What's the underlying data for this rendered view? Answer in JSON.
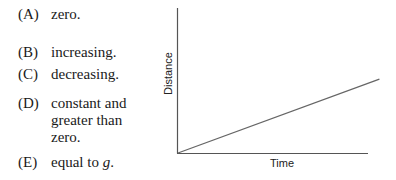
{
  "choices": [
    {
      "letter": "(A)",
      "text": "zero."
    },
    {
      "letter": "(B)",
      "text": "increasing."
    },
    {
      "letter": "(C)",
      "text": "decreasing."
    },
    {
      "letter": "(D)",
      "text": "constant and greater than zero."
    },
    {
      "letter": "(E)",
      "text_prefix": "equal to ",
      "text_var": "g",
      "text_suffix": "."
    }
  ],
  "chart_data": {
    "type": "line",
    "title": "",
    "xlabel": "Time",
    "ylabel": "Distance",
    "grid": false,
    "legend": null,
    "xlim": [
      0,
      1
    ],
    "ylim": [
      0,
      1
    ],
    "series": [
      {
        "name": "distance-vs-time",
        "x": [
          0,
          1.06
        ],
        "y": [
          0,
          0.51
        ]
      }
    ],
    "colors": {
      "axis": "#555555",
      "line": "#666666"
    }
  }
}
